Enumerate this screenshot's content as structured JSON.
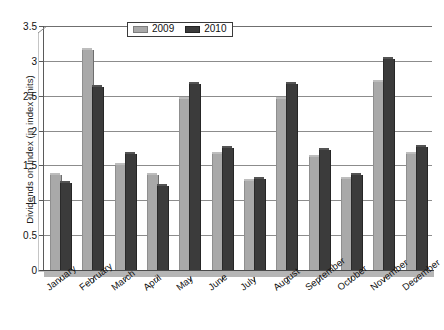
{
  "chart_data": {
    "type": "bar",
    "title": "",
    "xlabel": "",
    "ylabel": "Dividends on Index (in index units)",
    "ylim": [
      0,
      3.5
    ],
    "ytick_labels": [
      "0",
      "0.5",
      "1",
      "1.5",
      "2",
      "2.5",
      "3",
      "3.5"
    ],
    "ytick_values": [
      0,
      0.5,
      1,
      1.5,
      2,
      2.5,
      3,
      3.5
    ],
    "grid": true,
    "legend_position": "top-center",
    "categories": [
      "January",
      "February",
      "March",
      "April",
      "May",
      "June",
      "July",
      "August",
      "September",
      "October",
      "November",
      "December"
    ],
    "series": [
      {
        "name": "2009",
        "color": "#a9a9a9",
        "values": [
          1.37,
          3.15,
          1.5,
          1.37,
          2.45,
          1.67,
          1.27,
          2.45,
          1.62,
          1.3,
          2.7,
          1.67
        ]
      },
      {
        "name": "2010",
        "color": "#3b3b3b",
        "values": [
          1.25,
          2.62,
          1.67,
          1.2,
          2.67,
          1.75,
          1.3,
          2.67,
          1.72,
          1.37,
          3.02,
          1.77
        ]
      }
    ]
  },
  "legend": {
    "items": [
      {
        "label": "2009",
        "swatch": "legend-swatch-2009"
      },
      {
        "label": "2010",
        "swatch": "legend-swatch-2010"
      }
    ]
  },
  "axes": {
    "y_title": "Dividends on Index (in index units)"
  }
}
